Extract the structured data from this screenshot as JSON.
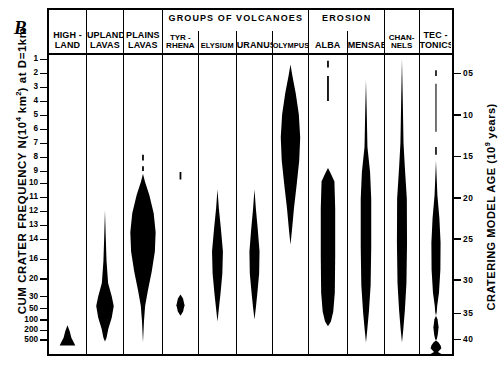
{
  "figure": {
    "panel_letter": "B",
    "left_axis": {
      "title_pre": "CUM CRATER FREQUENCY N(10",
      "title_sup": "4",
      "title_post": " km",
      "title_sup2": "2",
      "title_tail": ") at D=1km"
    },
    "right_axis": {
      "title_pre": "CRATERING MODEL AGE (10",
      "title_sup": "9",
      "title_post": " years)",
      "model": "(MODEL II)"
    }
  },
  "chart_data": {
    "type": "violin",
    "ylabel": "CUM CRATER FREQUENCY N(10^4 km^2) at D=1km",
    "ylabel_right": "CRATERING MODEL AGE (10^9 years) (MODEL II)",
    "grid": false,
    "legend": "none",
    "y_left_ticks": [
      "1",
      "2",
      "3",
      "4",
      "5",
      "6",
      "7",
      "8",
      "9",
      "10",
      "11",
      "12",
      "13",
      "14",
      "16",
      "20",
      "30",
      "50",
      "100",
      "200",
      "500"
    ],
    "y_left_tick_positions": [
      4.5,
      19.0,
      33.5,
      48.0,
      62.5,
      77.0,
      91.5,
      106.0,
      120.5,
      133.0,
      147.5,
      162.0,
      176.5,
      191.0,
      212.0,
      232.0,
      250.5,
      263.0,
      274.5,
      285.5,
      295.5
    ],
    "y_right_ticks": [
      "05",
      "10",
      "15",
      "20",
      "25",
      "30",
      "35",
      "40"
    ],
    "y_right_tick_positions": [
      19.0,
      62.0,
      105.0,
      148.0,
      190.5,
      233.0,
      268.0,
      295.0
    ],
    "group_headers": [
      {
        "label": "GROUPS OF VOLCANOES",
        "start_col": 3,
        "end_col": 6
      },
      {
        "label": "EROSION",
        "start_col": 7,
        "end_col": 8
      }
    ],
    "categories": [
      {
        "name": "HIGHLAND",
        "header_top": "HIGH -",
        "header_bottom": "LAND",
        "width": 38
      },
      {
        "name": "UPLAND LAVAS",
        "header_top": "UPLAND",
        "header_bottom": "LAVAS",
        "width": 37
      },
      {
        "name": "PLAINS LAVAS",
        "header_top": "PLAINS",
        "header_bottom": "LAVAS",
        "width": 39
      },
      {
        "name": "TYRRHENA",
        "header_two": "TYR -\nRHENA",
        "width": 36
      },
      {
        "name": "ELYSIUM",
        "header_bottom": "ELYSIUM",
        "width": 38
      },
      {
        "name": "URANUS",
        "header_bottom": "URANUS",
        "width": 36
      },
      {
        "name": "OLYMPUS",
        "header_bottom": "OLYMPUS",
        "width": 36
      },
      {
        "name": "ALBA",
        "header_bottom": "ALBA",
        "width": 39
      },
      {
        "name": "MENSAE",
        "header_bottom": "MENSAE",
        "width": 37
      },
      {
        "name": "CHANNELS",
        "header_two": "CHAN-\nNELS",
        "width": 35
      },
      {
        "name": "TECTONICS",
        "header_top": "TEC -",
        "header_bottom": "TONICS",
        "width": 32
      }
    ],
    "violins": [
      {
        "category": "HIGHLAND",
        "note": "narrow spike near bottom, frequency 200-500",
        "segments": [
          {
            "points": [
              [
                0,
                282
              ],
              [
                2.2,
                288
              ],
              [
                4.0,
                295
              ],
              [
                6.5,
                300
              ],
              [
                8.0,
                303
              ],
              [
                0,
                303
              ]
            ],
            "mirror": true
          }
        ]
      },
      {
        "category": "UPLAND LAVAS",
        "note": "long thin tail from 12 broadening to a lens at 50-100",
        "segments": [
          {
            "points": [
              [
                0,
                162
              ],
              [
                0.8,
                190
              ],
              [
                1.6,
                215
              ],
              [
                3.2,
                238
              ],
              [
                7.0,
                252
              ],
              [
                9.0,
                262
              ],
              [
                7.0,
                274
              ],
              [
                3.4,
                286
              ],
              [
                1.6,
                295
              ],
              [
                0,
                299
              ]
            ],
            "mirror": true
          }
        ]
      },
      {
        "category": "PLAINS LAVAS",
        "note": "dashes at 8 and 8.6; big lens from 9 to 50 peaking near 13",
        "segments": [
          {
            "points": [
              [
                0,
                104
              ],
              [
                0.9,
                104
              ],
              [
                0.9,
                110
              ],
              [
                0,
                110
              ]
            ],
            "mirror": true
          },
          {
            "points": [
              [
                0,
                116
              ],
              [
                0.9,
                116
              ],
              [
                0.9,
                121
              ],
              [
                0,
                121
              ]
            ],
            "mirror": true
          },
          {
            "points": [
              [
                0,
                124
              ],
              [
                2.0,
                132
              ],
              [
                6.5,
                146
              ],
              [
                11.0,
                165
              ],
              [
                13.0,
                185
              ],
              [
                12.2,
                205
              ],
              [
                9.0,
                226
              ],
              [
                5.0,
                246
              ],
              [
                2.2,
                262
              ],
              [
                1.0,
                278
              ],
              [
                0,
                300
              ]
            ],
            "mirror": true
          }
        ]
      },
      {
        "category": "TYRRHENA",
        "note": "tiny dash near 9.5 and small round blob near 50",
        "segments": [
          {
            "points": [
              [
                0,
                122
              ],
              [
                0.9,
                122
              ],
              [
                0.9,
                130
              ],
              [
                0,
                130
              ]
            ],
            "mirror": true
          },
          {
            "points": [
              [
                0,
                250
              ],
              [
                2.6,
                254
              ],
              [
                4.2,
                261
              ],
              [
                2.6,
                268
              ],
              [
                0,
                272
              ]
            ],
            "mirror": true
          }
        ]
      },
      {
        "category": "ELYSIUM",
        "note": "slim symmetric lens from 10 to 30, peak near 16",
        "segments": [
          {
            "points": [
              [
                0,
                140
              ],
              [
                1.4,
                160
              ],
              [
                3.6,
                182
              ],
              [
                5.6,
                205
              ],
              [
                5.0,
                228
              ],
              [
                3.2,
                248
              ],
              [
                1.4,
                265
              ],
              [
                0,
                278
              ]
            ],
            "mirror": true
          }
        ]
      },
      {
        "category": "URANUS",
        "note": "slim symmetric lens from 10 to 30, peak near 16",
        "segments": [
          {
            "points": [
              [
                0,
                140
              ],
              [
                1.4,
                160
              ],
              [
                3.4,
                182
              ],
              [
                5.2,
                205
              ],
              [
                4.8,
                228
              ],
              [
                3.0,
                248
              ],
              [
                1.4,
                264
              ],
              [
                0,
                276
              ]
            ],
            "mirror": true
          }
        ]
      },
      {
        "category": "OLYMPUS",
        "note": "tall wide lens high on the scale, peak near 4-5",
        "segments": [
          {
            "points": [
              [
                0,
                10
              ],
              [
                2.0,
                22
              ],
              [
                5.4,
                40
              ],
              [
                8.6,
                62
              ],
              [
                10.0,
                86
              ],
              [
                9.0,
                110
              ],
              [
                6.4,
                135
              ],
              [
                3.6,
                160
              ],
              [
                1.6,
                182
              ],
              [
                0,
                198
              ]
            ],
            "mirror": true
          }
        ]
      },
      {
        "category": "ALBA",
        "note": "dashes near 1 and 3; thick blunt column from 9 to 40",
        "segments": [
          {
            "points": [
              [
                0,
                6
              ],
              [
                0.9,
                6
              ],
              [
                0.9,
                13
              ],
              [
                0,
                13
              ]
            ],
            "mirror": true
          },
          {
            "points": [
              [
                0,
                22
              ],
              [
                0.9,
                22
              ],
              [
                0.9,
                48
              ],
              [
                0,
                48
              ]
            ],
            "mirror": true
          },
          {
            "points": [
              [
                0,
                118
              ],
              [
                3.0,
                124
              ],
              [
                6.6,
                132
              ],
              [
                7.4,
                160
              ],
              [
                7.4,
                210
              ],
              [
                7.0,
                248
              ],
              [
                5.4,
                268
              ],
              [
                3.0,
                278
              ],
              [
                0,
                283
              ]
            ],
            "mirror": true
          }
        ]
      },
      {
        "category": "MENSAE",
        "note": "needle from 2.5 widening into a long band 14-40",
        "segments": [
          {
            "points": [
              [
                0,
                26
              ],
              [
                0.8,
                60
              ],
              [
                1.5,
                96
              ],
              [
                4.2,
                122
              ],
              [
                5.4,
                150
              ],
              [
                5.4,
                200
              ],
              [
                4.8,
                240
              ],
              [
                3.0,
                268
              ],
              [
                1.4,
                286
              ],
              [
                0,
                300
              ]
            ],
            "mirror": true
          }
        ]
      },
      {
        "category": "CHANNELS",
        "note": "needle from top widening into a long band 16-40",
        "segments": [
          {
            "points": [
              [
                0,
                4
              ],
              [
                0.8,
                46
              ],
              [
                1.6,
                92
              ],
              [
                3.0,
                118
              ],
              [
                5.0,
                150
              ],
              [
                5.2,
                196
              ],
              [
                4.6,
                238
              ],
              [
                3.0,
                266
              ],
              [
                1.4,
                286
              ],
              [
                0,
                300
              ]
            ],
            "mirror": true
          }
        ]
      },
      {
        "category": "TECTONICS",
        "note": "dash near 1.5, thin line 2-9, dash 14, lens 20-32, pinch, blob 36-40, flare at base",
        "segments": [
          {
            "points": [
              [
                0,
                16
              ],
              [
                0.8,
                16
              ],
              [
                0.8,
                22
              ],
              [
                0,
                22
              ]
            ],
            "mirror": true
          },
          {
            "points": [
              [
                0,
                30
              ],
              [
                0.55,
                30
              ],
              [
                0.55,
                80
              ],
              [
                0,
                80
              ]
            ],
            "mirror": true
          },
          {
            "points": [
              [
                0,
                96
              ],
              [
                0.8,
                96
              ],
              [
                0.8,
                104
              ],
              [
                0,
                104
              ]
            ],
            "mirror": true
          },
          {
            "points": [
              [
                0,
                110
              ],
              [
                0.7,
                128
              ],
              [
                1.4,
                146
              ],
              [
                3.4,
                170
              ],
              [
                4.6,
                196
              ],
              [
                4.4,
                224
              ],
              [
                3.0,
                248
              ],
              [
                1.2,
                262
              ],
              [
                0.8,
                268
              ],
              [
                0,
                272
              ]
            ],
            "mirror": true
          },
          {
            "points": [
              [
                0,
                272
              ],
              [
                1.6,
                276
              ],
              [
                2.6,
                284
              ],
              [
                1.8,
                292
              ],
              [
                0.9,
                296
              ],
              [
                0,
                298
              ]
            ],
            "mirror": true
          },
          {
            "points": [
              [
                0,
                298
              ],
              [
                2.6,
                300
              ],
              [
                4.6,
                303
              ],
              [
                5.4,
                306
              ],
              [
                2.0,
                310
              ],
              [
                5.4,
                312
              ],
              [
                0,
                312
              ]
            ],
            "mirror": true
          }
        ]
      }
    ]
  }
}
